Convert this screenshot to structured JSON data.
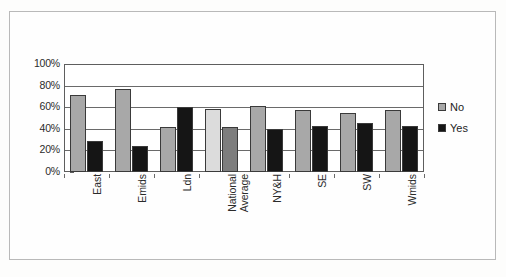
{
  "chart_data": {
    "type": "bar",
    "title": "",
    "xlabel": "",
    "ylabel": "",
    "ylim": [
      0,
      100
    ],
    "ytick_labels": [
      "100%",
      "80%",
      "60%",
      "40%",
      "20%",
      "0%"
    ],
    "ytick_values": [
      100,
      80,
      60,
      40,
      20,
      0
    ],
    "grid": true,
    "legend_position": "right",
    "categories": [
      "East",
      "Emids",
      "Ldn",
      "National Average",
      "NY&H",
      "SE",
      "SW",
      "Wmids"
    ],
    "series": [
      {
        "name": "No",
        "color": "#a8a8a8",
        "values": [
          71,
          77,
          42,
          58,
          61,
          57,
          55,
          57
        ]
      },
      {
        "name": "Yes",
        "color": "#151515",
        "values": [
          29,
          24,
          60,
          42,
          40,
          43,
          45,
          43
        ]
      }
    ],
    "bar_colors": {
      "no_default": "#a8a8a8",
      "yes_default": "#151515",
      "national_average_no": "#dcdcdc",
      "national_average_yes": "#7d7d7d"
    }
  },
  "legend": {
    "items": [
      {
        "label": "No",
        "color": "#a8a8a8"
      },
      {
        "label": "Yes",
        "color": "#151515"
      }
    ]
  },
  "axis": {
    "y_ticks": [
      {
        "label": "100%",
        "value": 100
      },
      {
        "label": "80%",
        "value": 80
      },
      {
        "label": "60%",
        "value": 60
      },
      {
        "label": "40%",
        "value": 40
      },
      {
        "label": "20%",
        "value": 20
      },
      {
        "label": "0%",
        "value": 0
      }
    ],
    "x_categories": [
      {
        "line1": "East",
        "line2": ""
      },
      {
        "line1": "Emids",
        "line2": ""
      },
      {
        "line1": "Ldn",
        "line2": ""
      },
      {
        "line1": "National",
        "line2": "Average"
      },
      {
        "line1": "NY&H",
        "line2": ""
      },
      {
        "line1": "SE",
        "line2": ""
      },
      {
        "line1": "SW",
        "line2": ""
      },
      {
        "line1": "Wmids",
        "line2": ""
      }
    ]
  }
}
